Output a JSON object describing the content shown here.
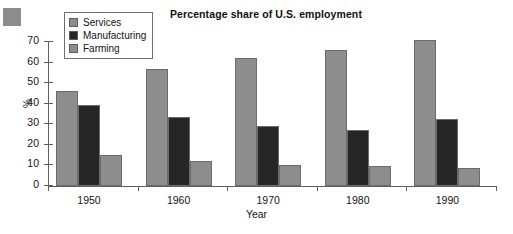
{
  "chart_data": {
    "type": "bar",
    "title": "Percentage share of U.S. employment",
    "xlabel": "Year",
    "ylabel": "%",
    "categories": [
      "1950",
      "1960",
      "1970",
      "1980",
      "1990"
    ],
    "series": [
      {
        "name": "Services",
        "color": "#8d8d8d",
        "values": [
          46,
          57,
          62,
          66,
          71
        ]
      },
      {
        "name": "Manufacturing",
        "color": "#262626",
        "values": [
          39.5,
          33.5,
          29,
          27,
          32.5
        ]
      },
      {
        "name": "Farming",
        "color": "#8d8d8d",
        "values": [
          15,
          12,
          10,
          9.7,
          9
        ]
      }
    ],
    "ylim": [
      0,
      70
    ],
    "yticks": [
      0,
      10,
      20,
      30,
      40,
      50,
      60,
      70
    ],
    "ytick_labels": [
      "0",
      "10",
      "20",
      "30",
      "40",
      "50",
      "60",
      "70"
    ],
    "grid": false,
    "legend_position": "top-left"
  },
  "legend": {
    "items": [
      {
        "label": "Services",
        "color": "#8d8d8d"
      },
      {
        "label": "Manufacturing",
        "color": "#262626"
      },
      {
        "label": "Farming",
        "color": "#8d8d8d"
      }
    ]
  },
  "colors": {
    "services": "#8d8d8d",
    "manufacturing": "#262626",
    "farming": "#8d8d8d",
    "axis": "#5f5f5f",
    "text": "#151515",
    "background": "#ffffff",
    "corner_square": "#8d8d8d"
  }
}
